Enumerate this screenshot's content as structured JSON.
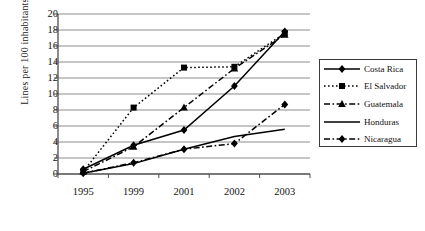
{
  "chart_data": {
    "type": "line",
    "title": "",
    "subtitle": "",
    "xlabel": "",
    "ylabel": "Lines per 100 inhabitants",
    "categories": [
      "1995",
      "1999",
      "2001",
      "2002",
      "2003"
    ],
    "ylim": [
      0,
      20
    ],
    "ytick_values": [
      0,
      2,
      4,
      6,
      8,
      10,
      12,
      14,
      16,
      18,
      20
    ],
    "ytick_labels": [
      "0",
      "2",
      "4",
      "6",
      "8",
      "10",
      "12",
      "14",
      "16",
      "18",
      "20"
    ],
    "grid": "horizontal",
    "legend_position": "right",
    "series": [
      {
        "name": "Costa Rica",
        "marker": "diamond",
        "linestyle": "solid",
        "color": "#000000",
        "values": [
          0.6,
          3.6,
          5.5,
          11.0,
          17.8
        ]
      },
      {
        "name": "El Salvador",
        "marker": "square",
        "linestyle": "dotted",
        "color": "#000000",
        "values": [
          0.3,
          8.3,
          13.3,
          13.4,
          17.6
        ]
      },
      {
        "name": "Guatemala",
        "marker": "triangle",
        "linestyle": "dashdot",
        "color": "#000000",
        "values": [
          0.3,
          3.4,
          8.3,
          13.2,
          17.4
        ]
      },
      {
        "name": "Honduras",
        "marker": "none",
        "linestyle": "solid",
        "color": "#000000",
        "values": [
          0.1,
          1.3,
          3.1,
          4.7,
          5.6
        ]
      },
      {
        "name": "Nicaragua",
        "marker": "diamond",
        "linestyle": "dashdot",
        "color": "#000000",
        "values": [
          0.1,
          1.4,
          3.1,
          3.8,
          8.7
        ]
      }
    ]
  },
  "legend": {
    "items": [
      {
        "label": "Costa Rica"
      },
      {
        "label": "El Salvador"
      },
      {
        "label": "Guatemala"
      },
      {
        "label": "Honduras"
      },
      {
        "label": "Nicaragua"
      }
    ]
  },
  "axes": {
    "y_title": "Lines per 100 inhabitants"
  }
}
